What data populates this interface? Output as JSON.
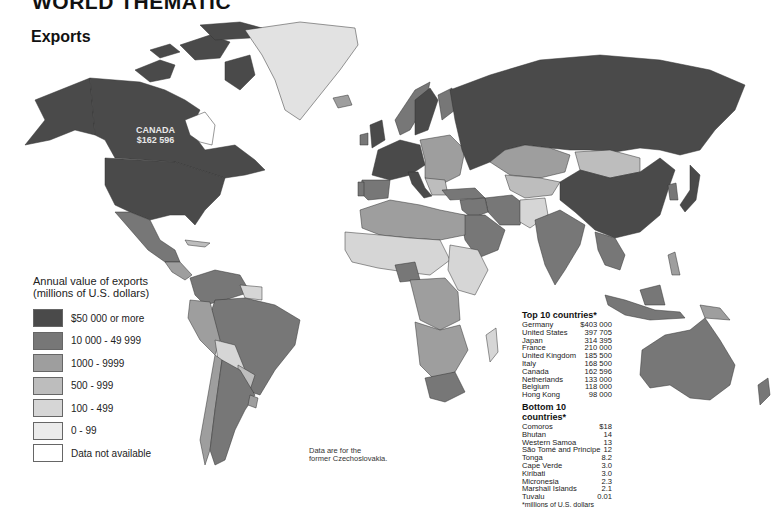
{
  "header": {
    "title": "WORLD THEMATIC"
  },
  "section": {
    "title": "Exports"
  },
  "map_labels": {
    "canada_name": "CANADA",
    "canada_value": "$162 596"
  },
  "legend": {
    "title_line1": "Annual value of exports",
    "title_line2": "(millions of U.S. dollars)",
    "items": [
      {
        "label": "$50 000 or more",
        "color": "#4a4a4a"
      },
      {
        "label": "10 000 - 49 999",
        "color": "#777777"
      },
      {
        "label": "1000 - 9999",
        "color": "#9e9e9e"
      },
      {
        "label": "500 - 999",
        "color": "#bdbdbd"
      },
      {
        "label": "100 - 499",
        "color": "#d6d6d6"
      },
      {
        "label": "0 - 99",
        "color": "#ebebeb"
      },
      {
        "label": "Data not available",
        "color": "#ffffff"
      }
    ]
  },
  "note": {
    "line1": "Data are for the",
    "line2": "former Czechoslovakia."
  },
  "top10": {
    "title": "Top 10 countries*",
    "rows": [
      {
        "country": "Germany",
        "value": "$403 000"
      },
      {
        "country": "United States",
        "value": "397 705"
      },
      {
        "country": "Japan",
        "value": "314 395"
      },
      {
        "country": "France",
        "value": "210 000"
      },
      {
        "country": "United Kingdom",
        "value": "185 500"
      },
      {
        "country": "Italy",
        "value": "168 500"
      },
      {
        "country": "Canada",
        "value": "162 596"
      },
      {
        "country": "Netherlands",
        "value": "133 000"
      },
      {
        "country": "Belgium",
        "value": "118 000"
      },
      {
        "country": "Hong Kong",
        "value": "98 000"
      }
    ]
  },
  "bottom10": {
    "title": "Bottom 10 countries*",
    "rows": [
      {
        "country": "Comoros",
        "value": "$18"
      },
      {
        "country": "Bhutan",
        "value": "14"
      },
      {
        "country": "Western Samoa",
        "value": "13"
      },
      {
        "country": "São Tomé and Principe",
        "value": "12"
      },
      {
        "country": "Tonga",
        "value": "8.2"
      },
      {
        "country": "Cape Verde",
        "value": "3.0"
      },
      {
        "country": "Kiribati",
        "value": "3.0"
      },
      {
        "country": "Micronesia",
        "value": "2.3"
      },
      {
        "country": "Marshall Islands",
        "value": "2.1"
      },
      {
        "country": "Tuvalu",
        "value": "0.01"
      }
    ],
    "footnote": "*millions of U.S. dollars"
  },
  "colors": {
    "c50k": "#4a4a4a",
    "c10k": "#777777",
    "c1k": "#9e9e9e",
    "c500": "#bdbdbd",
    "c100": "#d6d6d6",
    "c0": "#ebebeb",
    "na": "#ffffff"
  }
}
